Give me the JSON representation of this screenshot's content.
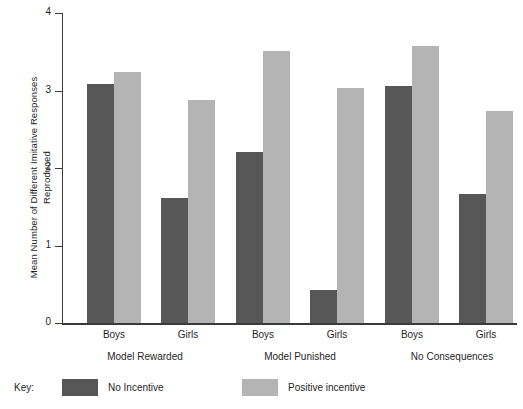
{
  "chart_data": {
    "type": "bar",
    "title": "",
    "xlabel": "",
    "ylabel": "Mean Number of Different Imitative Responses\nReproduced",
    "ylim": [
      0,
      4
    ],
    "yticks": [
      "0",
      "1",
      "2",
      "3",
      "4"
    ],
    "grid": false,
    "legend_position": "bottom-left",
    "legend_title": "Key:",
    "categories": [
      "Boys",
      "Girls",
      "Boys",
      "Girls",
      "Boys",
      "Girls"
    ],
    "groups": [
      {
        "label": "Model Rewarded",
        "categories": [
          "Boys",
          "Girls"
        ]
      },
      {
        "label": "Model Punished",
        "categories": [
          "Boys",
          "Girls"
        ]
      },
      {
        "label": "No Consequences",
        "categories": [
          "Boys",
          "Girls"
        ]
      }
    ],
    "series": [
      {
        "name": "No Incentive",
        "color": "#575757",
        "values": [
          3.08,
          1.61,
          2.21,
          0.43,
          3.06,
          1.66
        ]
      },
      {
        "name": "Positive incentive",
        "color": "#b4b4b4",
        "values": [
          3.24,
          2.88,
          3.51,
          3.03,
          3.57,
          2.73
        ]
      }
    ]
  },
  "axis": {
    "y_label_line1": "Mean Number of Different Imitative Responses",
    "y_label_line2": "Reproduced",
    "y_ticks": [
      "4",
      "3",
      "2",
      "1",
      "0"
    ]
  },
  "x_labels": {
    "cat_0": "Boys",
    "cat_1": "Girls",
    "cat_2": "Boys",
    "cat_3": "Girls",
    "cat_4": "Boys",
    "cat_5": "Girls",
    "group_0": "Model Rewarded",
    "group_1": "Model Punished",
    "group_2": "No Consequences"
  },
  "legend": {
    "key_label": "Key:",
    "item_0_label": "No Incentive",
    "item_1_label": "Positive incentive"
  }
}
